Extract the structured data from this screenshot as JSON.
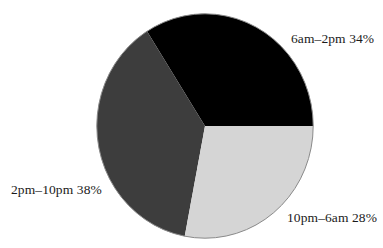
{
  "chart_data": {
    "type": "pie",
    "title": "",
    "subtitle": "",
    "xlabel": "",
    "ylabel": "",
    "legend_position": "none",
    "grid": false,
    "labels_on_slices": false,
    "label_placement": "outside",
    "categories": [
      "6am-2pm",
      "2pm-10pm",
      "10pm-6am"
    ],
    "values": [
      34,
      38,
      28
    ],
    "value_unit": "%",
    "slices": [
      {
        "category": "6am-2pm",
        "value": 34,
        "label": "6am–2pm 34%",
        "color": "#000000",
        "start_angle_deg": 0,
        "end_angle_deg": 122.4
      },
      {
        "category": "2pm-10pm",
        "value": 38,
        "label": "2pm–10pm 38%",
        "color": "#3d3d3d",
        "start_angle_deg": 122.4,
        "end_angle_deg": 259.2
      },
      {
        "category": "10pm-6am",
        "value": 28,
        "label": "10pm–6am 28%",
        "color": "#d5d5d5",
        "start_angle_deg": 259.2,
        "end_angle_deg": 360
      }
    ],
    "total": 100,
    "colors": {
      "background": "#ffffff",
      "text": "#1a1a1a",
      "outline": "#8a8a8a",
      "slice_1": "#000000",
      "slice_2": "#3d3d3d",
      "slice_3": "#d5d5d5"
    }
  }
}
